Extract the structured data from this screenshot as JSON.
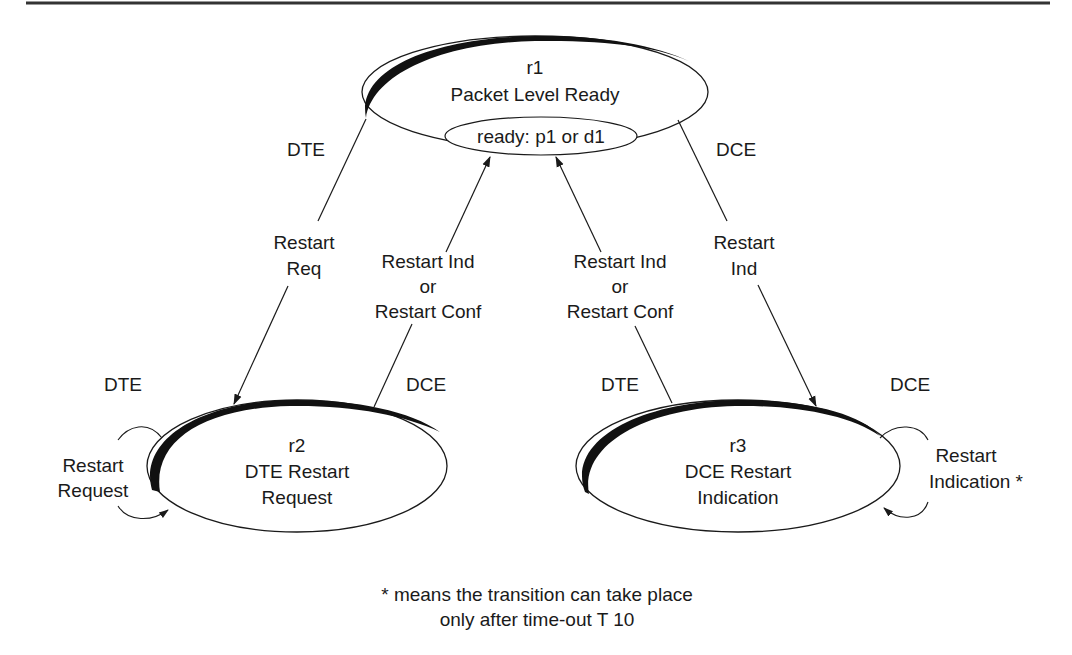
{
  "diagram": {
    "type": "state-transition",
    "colors": {
      "ink": "#1a1a1a",
      "background": "#ffffff",
      "rule": "#333333"
    },
    "states": {
      "r1": {
        "id": "r1",
        "name": "Packet Level Ready",
        "substate": "ready: p1 or d1"
      },
      "r2": {
        "id": "r2",
        "name_line1": "DTE Restart",
        "name_line2": "Request"
      },
      "r3": {
        "id": "r3",
        "name_line1": "DCE Restart",
        "name_line2": "Indication"
      }
    },
    "transitions": {
      "r1_to_r2": {
        "side": "DTE",
        "line1": "Restart",
        "line2": "Req"
      },
      "r2_to_r1": {
        "side": "DCE",
        "line1": "Restart Ind",
        "line2": "or",
        "line3": "Restart Conf"
      },
      "r3_to_r1": {
        "side": "DTE",
        "line1": "Restart Ind",
        "line2": "or",
        "line3": "Restart Conf"
      },
      "r1_to_r3": {
        "side": "DCE",
        "line1": "Restart",
        "line2": "Ind"
      },
      "r2_self": {
        "side": "DTE",
        "line1": "Restart",
        "line2": "Request"
      },
      "r3_self": {
        "side": "DCE",
        "line1": "Restart",
        "line2": "Indication *"
      }
    },
    "footnote": {
      "line1": "* means the transition can take place",
      "line2": "only after time-out T 10"
    }
  }
}
